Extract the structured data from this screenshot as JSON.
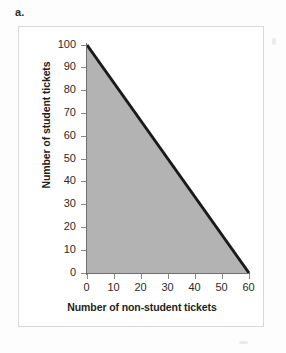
{
  "part_label": "a.",
  "chart_data": {
    "type": "area",
    "title": "",
    "subtitle": "",
    "xlabel": "Number of non-student tickets",
    "ylabel": "Number of student tickets",
    "xlim": [
      0,
      60
    ],
    "ylim": [
      0,
      100
    ],
    "xticks": [
      0,
      10,
      20,
      30,
      40,
      50,
      60
    ],
    "yticks": [
      0,
      10,
      20,
      30,
      40,
      50,
      60,
      70,
      80,
      90,
      100
    ],
    "xtick_labels": [
      "0",
      "10",
      "20",
      "30",
      "40",
      "50",
      "60"
    ],
    "ytick_labels": [
      "0",
      "10",
      "20",
      "30",
      "40",
      "50",
      "60",
      "70",
      "80",
      "90",
      "100"
    ],
    "grid": false,
    "legend": null,
    "legend_position": "none",
    "series": [
      {
        "name": "Constraint boundary",
        "type": "line",
        "color": "#1a1a1a",
        "line_width": 3,
        "x": [
          0,
          60
        ],
        "values": [
          100,
          0
        ],
        "annotation": "Line from (0, 100) to (60, 0)"
      },
      {
        "name": "Feasible region",
        "type": "shaded-area",
        "color": "#b3b3b3",
        "vertices_x": [
          0,
          0,
          60
        ],
        "vertices_y": [
          0,
          100,
          0
        ],
        "annotation": "Shaded triangle bounded by the axes and the constraint line"
      }
    ]
  },
  "colors": {
    "shaded_region": "#b3b3b3",
    "constraint_line": "#1a1a1a",
    "axis": "#6f6f6f",
    "frame_border": "#d8d8d8",
    "text": "#231f20",
    "background": "#ffffff"
  }
}
